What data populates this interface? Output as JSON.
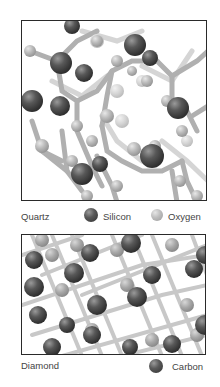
{
  "figure": {
    "panels": [
      {
        "id": "quartz",
        "name": "Quartz",
        "legend": [
          {
            "label": "Silicon",
            "color": "#4a4a4a",
            "icon": "silicon-atom-icon"
          },
          {
            "label": "Oxygen",
            "color": "#b5b5b5",
            "icon": "oxygen-atom-icon"
          }
        ]
      },
      {
        "id": "diamond",
        "name": "Diamond",
        "legend": [
          {
            "label": "Carbon",
            "color": "#4a4a4a",
            "icon": "carbon-atom-icon"
          }
        ]
      }
    ]
  }
}
